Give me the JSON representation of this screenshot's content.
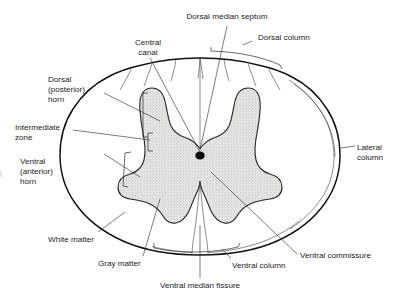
{
  "figure": {
    "background_color": "#ffffff",
    "line_color": "#111111",
    "gray_matter_color": "#d8d8d2",
    "white_matter_color": "#ffffff",
    "central_canal_color": "#0b0b0b",
    "width": 400,
    "height": 299
  },
  "labels": {
    "dorsal_median_septum": "Dorsal median septum",
    "dorsal_column": "Dorsal column",
    "central_canal_line1": "Central",
    "central_canal_line2": "canal",
    "dorsal_horn_line1": "Dorsal",
    "dorsal_horn_line2": "(posterior)",
    "dorsal_horn_line3": "horn",
    "intermediate_zone_line1": "Intermediate",
    "intermediate_zone_line2": "zone",
    "ventral_horn_line1": "Ventral",
    "ventral_horn_line2": "(anterior)",
    "ventral_horn_line3": "horn",
    "white_matter": "White matter",
    "gray_matter": "Gray matter",
    "ventral_median_fissure": "Ventral median fissure",
    "ventral_column": "Ventral column",
    "ventral_commissure": "Ventral commissure",
    "lateral_column_line1": "Lateral",
    "lateral_column_line2": "column"
  },
  "structures": [
    {
      "name": "dorsal-median-septum",
      "label": "Dorsal median septum"
    },
    {
      "name": "dorsal-column",
      "label": "Dorsal column"
    },
    {
      "name": "central-canal",
      "label": "Central canal"
    },
    {
      "name": "dorsal-posterior-horn",
      "label": "Dorsal (posterior) horn"
    },
    {
      "name": "intermediate-zone",
      "label": "Intermediate zone"
    },
    {
      "name": "ventral-anterior-horn",
      "label": "Ventral (anterior) horn"
    },
    {
      "name": "white-matter",
      "label": "White matter"
    },
    {
      "name": "gray-matter",
      "label": "Gray matter"
    },
    {
      "name": "ventral-median-fissure",
      "label": "Ventral median fissure"
    },
    {
      "name": "ventral-column",
      "label": "Ventral column"
    },
    {
      "name": "ventral-commissure",
      "label": "Ventral commissure"
    },
    {
      "name": "lateral-column",
      "label": "Lateral column"
    }
  ]
}
